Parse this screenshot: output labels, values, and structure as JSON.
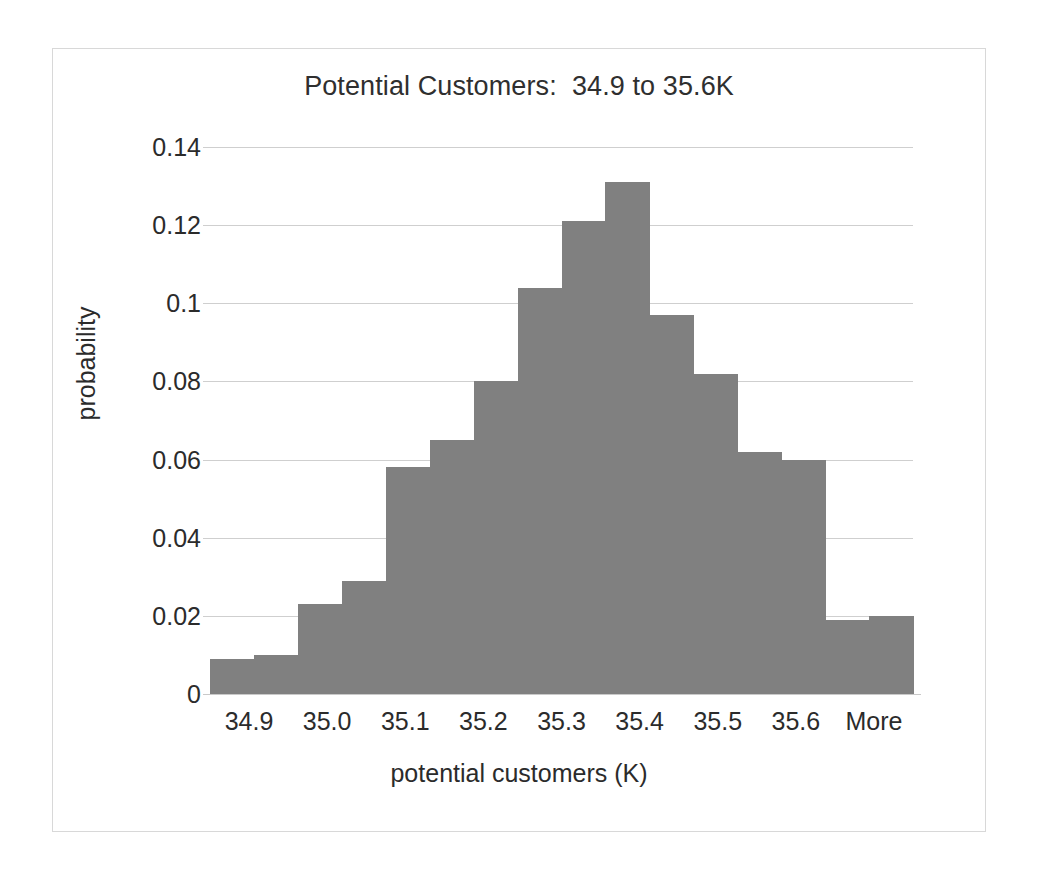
{
  "chart_data": {
    "type": "bar",
    "title": "Potential Customers:  34.9 to 35.6K",
    "xlabel": "potential customers (K)",
    "ylabel": "probability",
    "ylim": [
      0,
      0.14
    ],
    "yticks": [
      "0",
      "0.02",
      "0.04",
      "0.06",
      "0.08",
      "0.1",
      "0.12",
      "0.14"
    ],
    "ytick_values": [
      0,
      0.02,
      0.04,
      0.06,
      0.08,
      0.1,
      0.12,
      0.14
    ],
    "xtick_labels": [
      "34.9",
      "35.0",
      "35.1",
      "35.2",
      "35.3",
      "35.4",
      "35.5",
      "35.6",
      "More"
    ],
    "grid": "horizontal",
    "legend": "none",
    "bar_color": "#808080",
    "gridline_color": "#cfcfcf",
    "axis_text_color": "#2b2b2b",
    "frame_color": "#d8d8d8",
    "bin_count": 16,
    "categories": [
      "34.9",
      "34.95",
      "35.0",
      "35.05",
      "35.1",
      "35.15",
      "35.2",
      "35.25",
      "35.3",
      "35.35",
      "35.4",
      "35.45",
      "35.5",
      "35.55",
      "35.6",
      "More"
    ],
    "values": [
      0.009,
      0.01,
      0.023,
      0.029,
      0.058,
      0.065,
      0.08,
      0.104,
      0.121,
      0.131,
      0.097,
      0.082,
      0.062,
      0.06,
      0.019,
      0.02
    ]
  },
  "annotations": {
    "peak_bin": "35.35",
    "peak_value": 0.131
  }
}
